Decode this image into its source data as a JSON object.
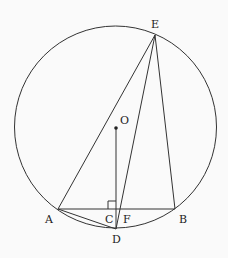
{
  "diagram": {
    "type": "circle-geometry",
    "circle": {
      "center": "O",
      "cx": 115.5,
      "cy": 127,
      "r": 101
    },
    "points": {
      "E": {
        "label": "E",
        "x": 155,
        "y": 35,
        "lx": 151,
        "ly": 28
      },
      "O": {
        "label": "O",
        "x": 116,
        "y": 128,
        "lx": 120,
        "ly": 124
      },
      "A": {
        "label": "A",
        "x": 58,
        "y": 209,
        "lx": 45,
        "ly": 223
      },
      "B": {
        "label": "B",
        "x": 175,
        "y": 209,
        "lx": 179,
        "ly": 223
      },
      "C": {
        "label": "C",
        "x": 116,
        "y": 209,
        "lx": 105,
        "ly": 223
      },
      "F": {
        "label": "F",
        "x": 121,
        "y": 209,
        "lx": 123,
        "ly": 223
      },
      "D": {
        "label": "D",
        "x": 116,
        "y": 229,
        "lx": 112,
        "ly": 243
      }
    },
    "segments": [
      "AE",
      "EF",
      "ED",
      "EB",
      "AB",
      "AD",
      "OD"
    ],
    "right_angle_at": "C",
    "stroke_color": "#333333",
    "background": "#fafafa"
  }
}
